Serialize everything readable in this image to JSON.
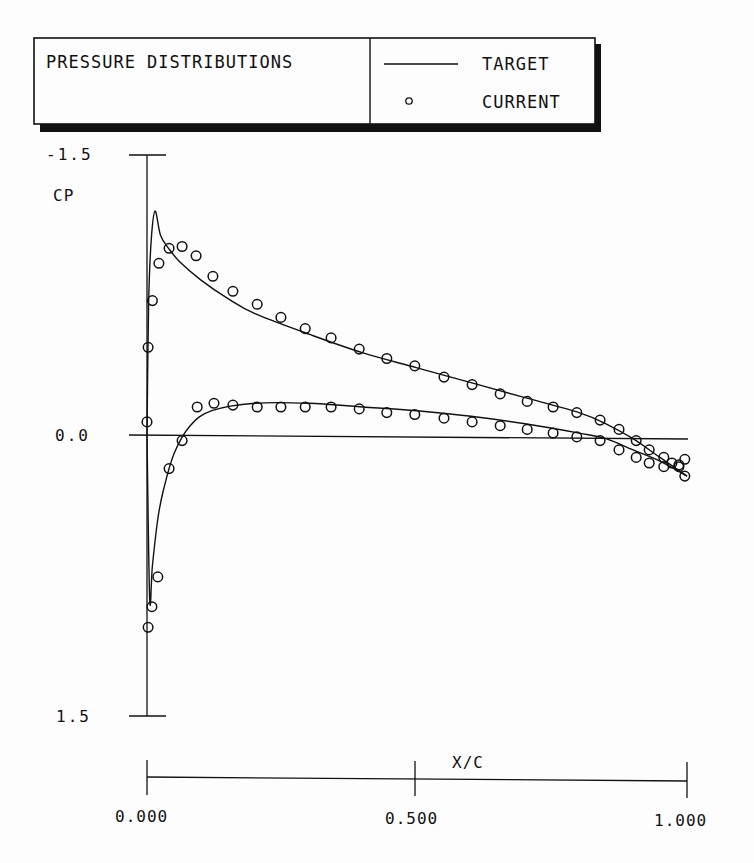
{
  "legend_box": {
    "title": "PRESSURE DISTRIBUTIONS",
    "entries": [
      {
        "symbol": "line",
        "label": "TARGET"
      },
      {
        "symbol": "circle",
        "label": "CURRENT"
      }
    ]
  },
  "y_axis": {
    "label": "CP",
    "ticks": [
      "-1.5",
      "0.0",
      "1.5"
    ]
  },
  "x_axis": {
    "label": "X/C",
    "ticks": [
      "0.000",
      "0.500",
      "1.000"
    ]
  },
  "colors": {
    "ink": "#111111",
    "background": "#fdfdfd"
  },
  "chart_data": {
    "type": "line",
    "title": "PRESSURE DISTRIBUTIONS",
    "xlabel": "X/C",
    "ylabel": "CP",
    "xlim": [
      0.0,
      1.0
    ],
    "ylim": [
      -1.5,
      1.5
    ],
    "y_inverted": true,
    "grid": false,
    "legend_position": "top-right box",
    "series": [
      {
        "name": "TARGET (upper surface)",
        "style": "line",
        "x": [
          0.0,
          0.003,
          0.008,
          0.015,
          0.025,
          0.04,
          0.06,
          0.1,
          0.15,
          0.2,
          0.3,
          0.4,
          0.5,
          0.6,
          0.7,
          0.8,
          0.85,
          0.9,
          0.95,
          1.0
        ],
        "y": [
          0.0,
          -0.7,
          -1.05,
          -1.2,
          -1.07,
          -1.0,
          -0.93,
          -0.83,
          -0.73,
          -0.65,
          -0.54,
          -0.44,
          -0.36,
          -0.28,
          -0.2,
          -0.12,
          -0.06,
          0.02,
          0.12,
          0.22
        ]
      },
      {
        "name": "TARGET (lower surface)",
        "style": "line",
        "x": [
          0.0,
          0.005,
          0.01,
          0.02,
          0.03,
          0.05,
          0.08,
          0.12,
          0.2,
          0.3,
          0.4,
          0.5,
          0.6,
          0.7,
          0.8,
          0.85,
          0.9,
          0.95,
          1.0
        ],
        "y": [
          0.0,
          0.88,
          0.7,
          0.45,
          0.3,
          0.1,
          -0.05,
          -0.13,
          -0.17,
          -0.17,
          -0.15,
          -0.13,
          -0.1,
          -0.06,
          -0.01,
          0.02,
          0.08,
          0.14,
          0.22
        ]
      },
      {
        "name": "CURRENT (upper surface)",
        "style": "circle",
        "x": [
          0.002,
          0.01,
          0.022,
          0.041,
          0.065,
          0.091,
          0.122,
          0.159,
          0.204,
          0.248,
          0.293,
          0.341,
          0.393,
          0.444,
          0.496,
          0.55,
          0.602,
          0.654,
          0.704,
          0.752,
          0.796,
          0.839,
          0.874,
          0.906,
          0.93,
          0.957,
          0.972,
          0.985,
          0.996
        ],
        "y": [
          -0.47,
          -0.72,
          -0.92,
          -1.0,
          -1.01,
          -0.96,
          -0.85,
          -0.77,
          -0.7,
          -0.63,
          -0.57,
          -0.52,
          -0.46,
          -0.41,
          -0.37,
          -0.31,
          -0.27,
          -0.22,
          -0.18,
          -0.15,
          -0.12,
          -0.08,
          -0.03,
          0.03,
          0.08,
          0.12,
          0.15,
          0.17,
          0.22
        ]
      },
      {
        "name": "CURRENT (lower surface)",
        "style": "circle",
        "x": [
          0.0,
          0.002,
          0.009,
          0.02,
          0.041,
          0.065,
          0.093,
          0.124,
          0.159,
          0.204,
          0.248,
          0.293,
          0.341,
          0.393,
          0.444,
          0.496,
          0.55,
          0.602,
          0.654,
          0.704,
          0.752,
          0.796,
          0.839,
          0.874,
          0.906,
          0.93,
          0.957,
          0.985,
          0.996
        ],
        "y": [
          -0.07,
          1.03,
          0.92,
          0.76,
          0.18,
          0.03,
          -0.15,
          -0.17,
          -0.16,
          -0.15,
          -0.15,
          -0.15,
          -0.15,
          -0.14,
          -0.12,
          -0.11,
          -0.09,
          -0.07,
          -0.05,
          -0.03,
          -0.01,
          0.01,
          0.03,
          0.08,
          0.12,
          0.15,
          0.17,
          0.16,
          0.13
        ]
      }
    ]
  }
}
